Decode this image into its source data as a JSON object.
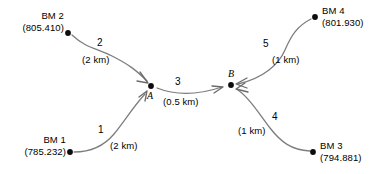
{
  "diagram": {
    "line_color": "#7d7d7d",
    "node_color": "#0d0d0d",
    "text_color": "#000000",
    "background": "#ffffff",
    "benchmarks": [
      {
        "id": "bm2",
        "name": "BM 2",
        "elevation": "(805.410)"
      },
      {
        "id": "bm4",
        "name": "BM 4",
        "elevation": "(801.930)"
      },
      {
        "id": "bm1",
        "name": "BM 1",
        "elevation": "(785.232)"
      },
      {
        "id": "bm3",
        "name": "BM 3",
        "elevation": "(794.881)"
      }
    ],
    "junctions": [
      {
        "id": "a",
        "label": "A"
      },
      {
        "id": "b",
        "label": "B"
      }
    ],
    "routes": [
      {
        "id": "route1",
        "number": "1",
        "distance": "(2 km)",
        "from": "BM 1",
        "to": "A"
      },
      {
        "id": "route2",
        "number": "2",
        "distance": "(2 km)",
        "from": "BM 2",
        "to": "A"
      },
      {
        "id": "route3",
        "number": "3",
        "distance": "(0.5 km)",
        "from": "A",
        "to": "B"
      },
      {
        "id": "route4",
        "number": "4",
        "distance": "(1 km)",
        "from": "BM 3",
        "to": "B"
      },
      {
        "id": "route5",
        "number": "5",
        "distance": "(1 km)",
        "from": "BM 4",
        "to": "B"
      }
    ]
  }
}
